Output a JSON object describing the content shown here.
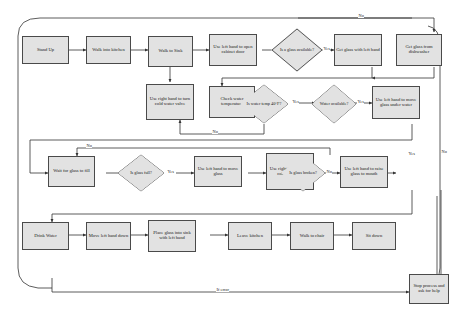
{
  "diagram": {
    "boundary": "rounded-rectangle",
    "colors": {
      "node_fill": "#e2e2e2",
      "node_stroke": "#4a4a4a",
      "connector": "#333333",
      "background": "#ffffff"
    },
    "caption": "",
    "nodes": [
      {
        "id": "n1",
        "type": "process",
        "label": "Stand Up"
      },
      {
        "id": "n2",
        "type": "process",
        "label": "Walk into kitchen"
      },
      {
        "id": "n3",
        "type": "process",
        "label": "Walk to Sink"
      },
      {
        "id": "n4",
        "type": "process",
        "label": "Use left hand to open cabinet door"
      },
      {
        "id": "d1",
        "type": "decision",
        "label": "Is a glass available?"
      },
      {
        "id": "n5",
        "type": "process",
        "label": "Get glass with left hand"
      },
      {
        "id": "n6",
        "type": "process",
        "label": "Get glass from dishwasher"
      },
      {
        "id": "n7",
        "type": "process",
        "label": "Use right hand to turn cold water valve"
      },
      {
        "id": "n8",
        "type": "process",
        "label": "Check water temperature"
      },
      {
        "id": "d2",
        "type": "decision",
        "label": "Is water temp 40°F?"
      },
      {
        "id": "d3",
        "type": "decision",
        "label": "Water available?"
      },
      {
        "id": "n9",
        "type": "process",
        "label": "Use left hand to move glass under water"
      },
      {
        "id": "n10",
        "type": "process",
        "label": "Wait for glass to fill"
      },
      {
        "id": "d4",
        "type": "decision",
        "label": "Is glass full?"
      },
      {
        "id": "n11",
        "type": "process",
        "label": "Use left hand to move glass"
      },
      {
        "id": "n12",
        "type": "process",
        "label": "Use right hand to turn cold water off"
      },
      {
        "id": "d5",
        "type": "decision",
        "label": "Is glass broken?"
      },
      {
        "id": "n13",
        "type": "process",
        "label": "Use left hand to raise glass to mouth"
      },
      {
        "id": "n14",
        "type": "process",
        "label": "Drink Water"
      },
      {
        "id": "n15",
        "type": "process",
        "label": "Move left hand down"
      },
      {
        "id": "n16",
        "type": "process",
        "label": "Place glass into sink with left hand"
      },
      {
        "id": "n17",
        "type": "process",
        "label": "Leave kitchen"
      },
      {
        "id": "n18",
        "type": "process",
        "label": "Walk to chair"
      },
      {
        "id": "n19",
        "type": "process",
        "label": "Sit down"
      },
      {
        "id": "n20",
        "type": "process",
        "label": "Stop process and ask for help"
      }
    ],
    "edge_labels": {
      "glass_available_yes": "Yes",
      "glass_available_no": "No",
      "water_temp_yes": "Yes",
      "water_temp_no": "No",
      "water_available_yes": "Yes",
      "glass_full_yes": "Yes",
      "glass_full_no": "No",
      "glass_broken_no": "No",
      "glass_broken_yes": "Yes",
      "right_rail_no": "No",
      "if_error": "If error"
    }
  }
}
